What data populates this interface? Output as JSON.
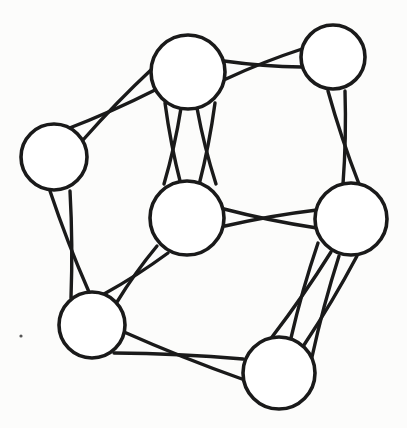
{
  "diagram": {
    "type": "graph",
    "stroke_color": "#1a1a1a",
    "node_fill": "#ffffff",
    "background": "#fcfcfb",
    "nodes": [
      {
        "id": "top-middle",
        "cx": 188,
        "cy": 72,
        "r": 37
      },
      {
        "id": "top-right",
        "cx": 333,
        "cy": 57,
        "r": 32
      },
      {
        "id": "left",
        "cx": 54,
        "cy": 157,
        "r": 33
      },
      {
        "id": "center",
        "cx": 187,
        "cy": 218,
        "r": 37
      },
      {
        "id": "right-middle",
        "cx": 351,
        "cy": 219,
        "r": 36
      },
      {
        "id": "bottom-left",
        "cx": 92,
        "cy": 325,
        "r": 33
      },
      {
        "id": "bottom-right",
        "cx": 279,
        "cy": 373,
        "r": 36
      }
    ],
    "edges": [
      {
        "from": "left",
        "to": "top-middle",
        "pairs": [
          {
            "a": [
              [
                67,
                129
              ],
              [
                155,
                90
              ]
            ],
            "b": [
              [
                83,
                140
              ],
              [
                153,
                68
              ]
            ]
          }
        ]
      },
      {
        "from": "top-middle",
        "to": "top-right",
        "pairs": [
          {
            "a": [
              [
                224,
                61
              ],
              [
                302,
                67
              ]
            ],
            "b": [
              [
                226,
                79
              ],
              [
                302,
                49
              ]
            ]
          }
        ]
      },
      {
        "from": "top-middle",
        "to": "center",
        "pairs": [
          {
            "a": [
              [
                165,
                103
              ],
              [
                181,
                185
              ]
            ],
            "b": [
              [
                181,
                108
              ],
              [
                164,
                184
              ]
            ]
          },
          {
            "a": [
              [
                197,
                108
              ],
              [
                216,
                184
              ]
            ],
            "b": [
              [
                215,
                103
              ],
              [
                199,
                185
              ]
            ]
          }
        ]
      },
      {
        "from": "top-right",
        "to": "right-middle",
        "pairs": [
          {
            "a": [
              [
                328,
                91
              ],
              [
                359,
                184
              ]
            ],
            "b": [
              [
                345,
                91
              ],
              [
                343,
                184
              ]
            ]
          }
        ]
      },
      {
        "from": "center",
        "to": "right-middle",
        "pairs": [
          {
            "a": [
              [
                224,
                209
              ],
              [
                317,
                228
              ]
            ],
            "b": [
              [
                225,
                226
              ],
              [
                317,
                210
              ]
            ]
          }
        ]
      },
      {
        "from": "left",
        "to": "bottom-left",
        "pairs": [
          {
            "a": [
              [
                50,
                191
              ],
              [
                89,
                292
              ]
            ],
            "b": [
              [
                70,
                191
              ],
              [
                71,
                298
              ]
            ]
          }
        ]
      },
      {
        "from": "center",
        "to": "bottom-left",
        "pairs": [
          {
            "a": [
              [
                157,
                246
              ],
              [
                117,
                302
              ]
            ],
            "b": [
              [
                168,
                253
              ],
              [
                104,
                294
              ]
            ]
          }
        ]
      },
      {
        "from": "right-middle",
        "to": "bottom-right",
        "pairs": [
          {
            "a": [
              [
                318,
                243
              ],
              [
                291,
                338
              ]
            ],
            "b": [
              [
                331,
                252
              ],
              [
                272,
                337
              ]
            ]
          },
          {
            "a": [
              [
                339,
                256
              ],
              [
                312,
                357
              ]
            ],
            "b": [
              [
                357,
                256
              ],
              [
                304,
                345
              ]
            ]
          }
        ]
      },
      {
        "from": "bottom-left",
        "to": "bottom-right",
        "pairs": [
          {
            "a": [
              [
                124,
                332
              ],
              [
                242,
                379
              ]
            ],
            "b": [
              [
                114,
                353
              ],
              [
                243,
                359
              ]
            ]
          }
        ]
      }
    ],
    "marks": [
      {
        "id": "speck",
        "cx": 21,
        "cy": 336,
        "r": 1.6
      }
    ]
  }
}
